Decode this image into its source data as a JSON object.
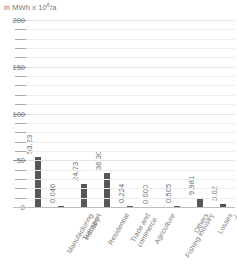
{
  "chart_data": {
    "type": "bar",
    "title": "",
    "unit_label": "in MWh x 10⁶/a",
    "unit_prefix": "in MWh x 10",
    "unit_exponent": "6",
    "unit_suffix": "/a",
    "xlabel": "",
    "ylabel": "in MWh x 10^6/a",
    "ylim": [
      0,
      200
    ],
    "ytick_labels": [
      "0",
      "50",
      "100",
      "150",
      "200"
    ],
    "ytick_values": [
      0,
      50,
      100,
      150,
      200
    ],
    "minor_tick_step": 10,
    "grid": true,
    "legend": "none",
    "bar_color": "#575757",
    "grid_color": "#ededed",
    "axis_color": "#bdbdbd",
    "text_color": "#7a7a7a",
    "categories": [
      "Manufacturing industry",
      "Transport",
      "Residential",
      "Trade and commerce",
      "Agriculture",
      "Fishing industry",
      "Others",
      "Losses",
      "-/-"
    ],
    "category_lines": [
      [
        "Manufacturing",
        "industry"
      ],
      [
        "Transport"
      ],
      [
        "Residential"
      ],
      [
        "Trade and",
        "commerce"
      ],
      [
        "Agriculture"
      ],
      [
        "Fishing industry"
      ],
      [
        "Others"
      ],
      [
        "Losses"
      ],
      [
        "-/-"
      ]
    ],
    "values": [
      53.23,
      0.046,
      24.73,
      36.3,
      0.224,
      0.0,
      0.505,
      9.981,
      3.02
    ],
    "value_labels": [
      "53.23",
      "0.046",
      "24.73",
      "36.30",
      "0.224",
      "0.000",
      "0.505",
      "9.981",
      "3.02"
    ]
  }
}
